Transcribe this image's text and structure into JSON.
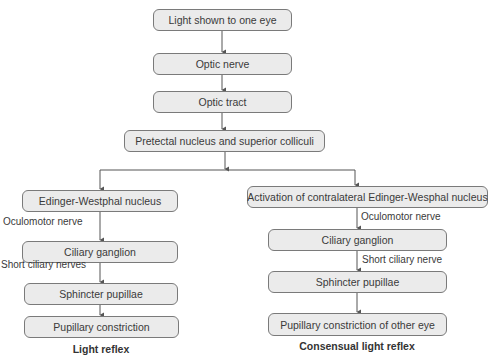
{
  "diagram": {
    "top_chain": [
      "Light shown to one eye",
      "Optic nerve",
      "Optic tract",
      "Pretectal nucleus and superior colliculi"
    ],
    "left_branch": {
      "boxes": [
        "Edinger-Westphal nucleus",
        "Ciliary ganglion",
        "Sphincter pupillae",
        "Pupillary constriction"
      ],
      "edge_labels": [
        "Oculomotor nerve",
        "Short ciliary nerves"
      ],
      "caption": "Light reflex"
    },
    "right_branch": {
      "boxes": [
        "Activation of contralateral Edinger-Wesphal nucleus",
        "Ciliary ganglion",
        "Sphincter pupillae",
        "Pupillary constriction of other eye"
      ],
      "edge_labels": [
        "Oculomotor nerve",
        "Short ciliary nerve"
      ],
      "caption": "Consensual light reflex"
    },
    "colors": {
      "box_fill": "#ebebeb",
      "box_border": "#7a7a7a",
      "line": "#555555"
    }
  }
}
